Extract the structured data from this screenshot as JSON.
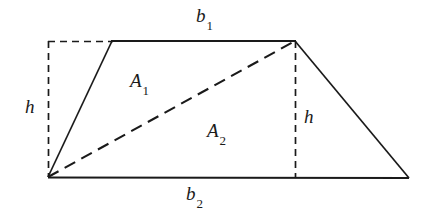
{
  "figure": {
    "name": "trapezoid-area-decomposition",
    "background_color": "#ffffff",
    "stroke_color": "#1a1a1a",
    "labels": {
      "top_base": {
        "base": "b",
        "sub": "1"
      },
      "bottom_base": {
        "base": "b",
        "sub": "2"
      },
      "upper_triangle": {
        "base": "A",
        "sub": "1"
      },
      "lower_triangle": {
        "base": "A",
        "sub": "2"
      },
      "height_left": {
        "base": "h",
        "sub": ""
      },
      "height_right": {
        "base": "h",
        "sub": ""
      }
    },
    "geometry": {
      "bottom_left": [
        48,
        177
      ],
      "bottom_right": [
        409,
        178
      ],
      "top_left_slant": [
        112,
        41
      ],
      "top_right": [
        295,
        41
      ],
      "dashed_corner_top_left": [
        48,
        41
      ],
      "solid_edges": [
        "bottom-base-from-48-177-to-409-178",
        "left-slant-from-48-177-to-112-41",
        "top-base-from-112-41-to-295-41",
        "right-slant-from-295-41-to-409-178"
      ],
      "dashed_edges": [
        "left-height-from-48-41-to-48-177",
        "top-extension-from-48-41-to-112-41",
        "right-height-from-295-41-to-295-178",
        "diagonal-from-48-177-to-295-41"
      ]
    }
  }
}
